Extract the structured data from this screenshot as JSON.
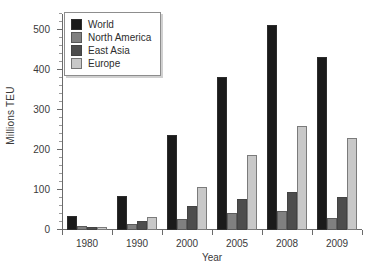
{
  "chart_data": {
    "type": "bar",
    "title": "",
    "subtitle": "",
    "xlabel": "Year",
    "ylabel": "Millions TEU",
    "categories": [
      "1980",
      "1990",
      "2000",
      "2005",
      "2008",
      "2009"
    ],
    "series": [
      {
        "name": "World",
        "color": "#1a1a1a",
        "values": [
          36,
          85,
          237,
          382,
          513,
          433
        ]
      },
      {
        "name": "North America",
        "color": "#808080",
        "values": [
          9,
          15,
          28,
          42,
          48,
          30
        ]
      },
      {
        "name": "East Asia",
        "color": "#4d4d4d",
        "values": [
          8,
          22,
          60,
          77,
          95,
          83
        ]
      },
      {
        "name": "Europe",
        "color": "#c8c8c8",
        "values": [
          8,
          32,
          107,
          188,
          260,
          231
        ]
      }
    ],
    "ylim": [
      0,
      540
    ],
    "yticks": [
      0,
      100,
      200,
      300,
      400,
      500
    ],
    "ytick_labels": [
      "0",
      "100",
      "200",
      "300",
      "400",
      "500"
    ],
    "yminor_step": 20,
    "grid": false,
    "legend_position": "top-left",
    "legend_entries": [
      "World",
      "North America",
      "East Asia",
      "Europe"
    ]
  }
}
